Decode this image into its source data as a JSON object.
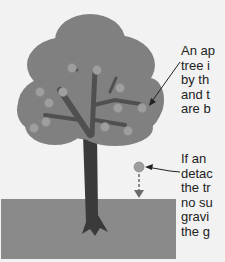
{
  "diagram": {
    "type": "illustration",
    "colors": {
      "background": "#f2f2f2",
      "ground": "#8a8a8a",
      "foliage": "#808080",
      "foliage_dark": "#707070",
      "trunk": "#3a3a3a",
      "apple": "#9e9e9e",
      "arrow": "#222222",
      "fall_arrow": "#6a6a6a",
      "text": "#222222"
    },
    "labels": {
      "top": {
        "lines": [
          "An ap",
          "tree i",
          "by th",
          "and t",
          "are b"
        ]
      },
      "bottom": {
        "lines": [
          "If an",
          "detac",
          "the tr",
          "no su",
          "gravi",
          "the g"
        ]
      }
    }
  }
}
